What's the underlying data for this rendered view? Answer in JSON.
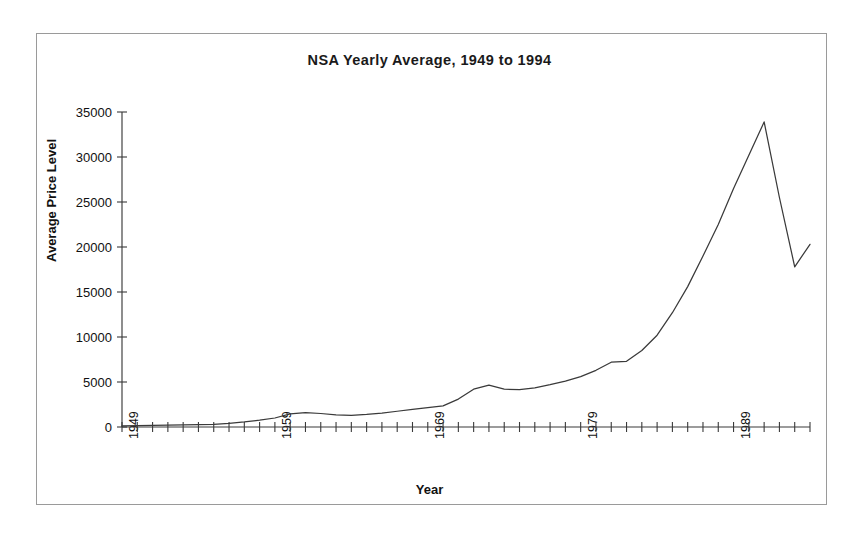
{
  "chart_data": {
    "type": "line",
    "title": "NSA Yearly Average, 1949 to 1994",
    "xlabel": "Year",
    "ylabel": "Average Price Level",
    "xlim": [
      1949,
      1994
    ],
    "ylim": [
      0,
      35000
    ],
    "ytick_values": [
      0,
      5000,
      10000,
      15000,
      20000,
      25000,
      30000,
      35000
    ],
    "ytick_labels": [
      "0",
      "5000",
      "10000",
      "15000",
      "20000",
      "25000",
      "30000",
      "35000"
    ],
    "xtick_labels": [
      "1949",
      "1959",
      "1969",
      "1979",
      "1989"
    ],
    "xtick_values": [
      1949,
      1959,
      1969,
      1979,
      1989
    ],
    "xtick_step": 1,
    "grid": false,
    "legend": false,
    "line_color": "#3a3a3a",
    "series": [
      {
        "name": "NSA Yearly Average",
        "x": [
          1949,
          1950,
          1951,
          1952,
          1953,
          1954,
          1955,
          1956,
          1957,
          1958,
          1959,
          1960,
          1961,
          1962,
          1963,
          1964,
          1965,
          1966,
          1967,
          1968,
          1969,
          1970,
          1971,
          1972,
          1973,
          1974,
          1975,
          1976,
          1977,
          1978,
          1979,
          1980,
          1981,
          1982,
          1983,
          1984,
          1985,
          1986,
          1987,
          1988,
          1989,
          1990,
          1991,
          1992,
          1993,
          1994
        ],
        "values": [
          120,
          140,
          170,
          200,
          230,
          260,
          300,
          400,
          560,
          760,
          1000,
          1450,
          1600,
          1500,
          1350,
          1300,
          1400,
          1550,
          1750,
          1950,
          2150,
          2350,
          3100,
          4200,
          4650,
          4200,
          4150,
          4350,
          4700,
          5100,
          5600,
          6300,
          7200,
          7300,
          8500,
          10200,
          12700,
          15600,
          19000,
          22500,
          26500,
          30200,
          33900,
          25500,
          17800,
          20300
        ]
      }
    ]
  }
}
